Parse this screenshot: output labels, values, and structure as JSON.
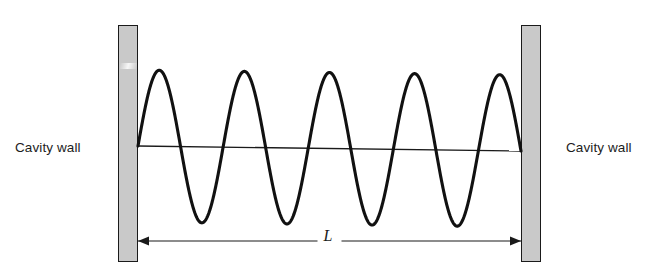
{
  "figure": {
    "type": "standing-wave-in-cavity",
    "background_color": "#ffffff",
    "line_color": "#111111",
    "wall_fill_color": "#c9c9c9",
    "wall_border_color": "#1a1a1a"
  },
  "labels": {
    "cavity_wall_left": "Cavity wall",
    "cavity_wall_right": "Cavity wall",
    "length": "L"
  },
  "walls": {
    "left": {
      "x": 118,
      "y": 25,
      "width": 20,
      "height": 237
    },
    "right": {
      "x": 521,
      "y": 25,
      "width": 20,
      "height": 237
    }
  },
  "axis_line": {
    "x1": 138,
    "y1": 146,
    "x2": 521,
    "y2": 151
  },
  "dimension": {
    "x1": 138,
    "y1": 241,
    "x2": 521,
    "y2": 241,
    "arrow_left": true,
    "arrow_right": true,
    "label": "L"
  },
  "wave": {
    "x_start": 138,
    "x_end": 521,
    "baseline_y_start": 146,
    "baseline_y_end": 151,
    "amplitude": 76,
    "half_wavelengths": 9,
    "wavelengths": 4.5,
    "crest_count": 5,
    "trough_count": 4,
    "crest_x": [
      158,
      245,
      330,
      415,
      500
    ],
    "trough_x": [
      200,
      288,
      373,
      458
    ],
    "crest_y": 72,
    "trough_y": 212,
    "stroke_width": 3.1
  }
}
